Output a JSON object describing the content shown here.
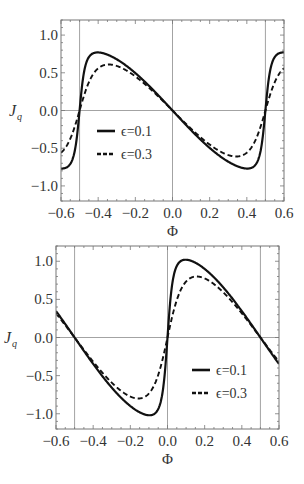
{
  "chart_data": [
    {
      "type": "line",
      "title": "",
      "xlabel": "Φ",
      "ylabel": "J_q",
      "xlim": [
        -0.6,
        0.6
      ],
      "ylim": [
        -1.2,
        1.2
      ],
      "xticks": [
        -0.6,
        -0.4,
        -0.2,
        0.0,
        0.2,
        0.4,
        0.6
      ],
      "xtick_labels": [
        "−0.6",
        "−0.4",
        "−0.2",
        "0.0",
        "0.2",
        "0.4",
        "0.6"
      ],
      "yticks": [
        -1.0,
        -0.5,
        0.0,
        0.5,
        1.0
      ],
      "ytick_labels": [
        "−1.0",
        "−0.5",
        "0.0",
        "0.5",
        "1.0"
      ],
      "grid_x": [
        -0.5,
        0.0,
        0.5
      ],
      "grid_y": [
        0.0
      ],
      "legend_position": "inside-left-lower",
      "phase_shift": 0.0,
      "series": [
        {
          "name": "ϵ=0.1",
          "epsilon": 0.1,
          "peak": 0.77,
          "style": "solid",
          "samples_x": [
            -0.6,
            -0.55,
            -0.52,
            -0.5,
            -0.48,
            -0.45,
            -0.4,
            -0.3,
            -0.2,
            -0.1,
            0.0,
            0.1,
            0.2,
            0.3,
            0.4,
            0.45,
            0.48,
            0.5,
            0.52,
            0.55,
            0.6
          ],
          "samples_y": [
            -0.72,
            -0.77,
            -0.55,
            0.0,
            0.55,
            0.77,
            0.72,
            0.62,
            0.46,
            0.24,
            0.0,
            -0.24,
            -0.46,
            -0.62,
            -0.72,
            -0.77,
            -0.55,
            0.0,
            0.55,
            0.77,
            0.72
          ]
        },
        {
          "name": "ϵ=0.3",
          "epsilon": 0.3,
          "peak": 0.61,
          "style": "dashed",
          "samples_x": [
            -0.6,
            -0.55,
            -0.52,
            -0.5,
            -0.48,
            -0.45,
            -0.4,
            -0.3,
            -0.2,
            -0.1,
            0.0,
            0.1,
            0.2,
            0.3,
            0.4,
            0.45,
            0.48,
            0.5,
            0.52,
            0.55,
            0.6
          ],
          "samples_y": [
            -0.6,
            -0.6,
            -0.35,
            0.0,
            0.35,
            0.6,
            0.6,
            0.57,
            0.45,
            0.24,
            0.0,
            -0.24,
            -0.45,
            -0.57,
            -0.6,
            -0.6,
            -0.35,
            0.0,
            0.35,
            0.6,
            0.6
          ]
        }
      ]
    },
    {
      "type": "line",
      "title": "",
      "xlabel": "Φ",
      "ylabel": "J_q",
      "xlim": [
        -0.6,
        0.6
      ],
      "ylim": [
        -1.2,
        1.2
      ],
      "xticks": [
        -0.6,
        -0.4,
        -0.2,
        0.0,
        0.2,
        0.4,
        0.6
      ],
      "xtick_labels": [
        "−0.6",
        "−0.4",
        "−0.2",
        "0.0",
        "0.2",
        "0.4",
        "0.6"
      ],
      "yticks": [
        -1.0,
        -0.5,
        0.0,
        0.5,
        1.0
      ],
      "ytick_labels": [
        "−1.0",
        "−0.5",
        "0.0",
        "0.5",
        "1.0"
      ],
      "grid_x": [
        -0.5,
        0.0,
        0.5
      ],
      "grid_y": [
        0.0
      ],
      "legend_position": "inside-right-lower",
      "phase_shift": 0.5,
      "series": [
        {
          "name": "ϵ=0.1",
          "epsilon": 0.1,
          "peak": 1.02,
          "style": "solid",
          "samples_x": [
            -0.6,
            -0.5,
            -0.4,
            -0.3,
            -0.2,
            -0.1,
            -0.05,
            -0.02,
            0.0,
            0.02,
            0.05,
            0.1,
            0.2,
            0.3,
            0.4,
            0.5,
            0.6
          ],
          "samples_y": [
            0.24,
            0.0,
            -0.24,
            -0.47,
            -0.71,
            -0.93,
            -1.02,
            -0.75,
            0.0,
            0.75,
            1.02,
            0.93,
            0.71,
            0.47,
            0.24,
            0.0,
            -0.24
          ]
        },
        {
          "name": "ϵ=0.3",
          "epsilon": 0.3,
          "peak": 0.8,
          "style": "dashed",
          "samples_x": [
            -0.6,
            -0.5,
            -0.4,
            -0.3,
            -0.2,
            -0.1,
            -0.08,
            -0.03,
            0.0,
            0.03,
            0.08,
            0.1,
            0.2,
            0.3,
            0.4,
            0.5,
            0.6
          ],
          "samples_y": [
            0.24,
            0.0,
            -0.24,
            -0.46,
            -0.66,
            -0.8,
            -0.8,
            -0.55,
            0.0,
            0.55,
            0.8,
            0.8,
            0.66,
            0.46,
            0.24,
            0.0,
            -0.24
          ]
        }
      ]
    }
  ],
  "panels": [
    {
      "frame": {
        "left": 61,
        "top": 20,
        "right": 284,
        "bottom": 201
      },
      "legend": {
        "x": 97,
        "y": 131,
        "items": [
          "ϵ=0.1",
          "ϵ=0.3"
        ]
      },
      "ylabel_main": "J",
      "ylabel_sub": "q",
      "xlabel": "Φ"
    },
    {
      "frame": {
        "left": 56,
        "top": 246,
        "right": 279,
        "bottom": 429
      },
      "legend": {
        "x": 192,
        "y": 370,
        "items": [
          "ϵ=0.1",
          "ϵ=0.3"
        ]
      },
      "ylabel_main": "J",
      "ylabel_sub": "q",
      "xlabel": "Φ"
    }
  ],
  "colors": {
    "curve": "#111111",
    "frame": "#777777",
    "grid": "#999999",
    "text": "#333333"
  }
}
